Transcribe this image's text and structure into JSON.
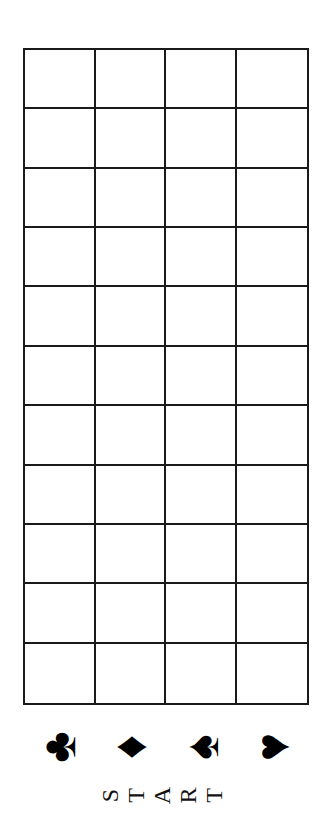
{
  "board": {
    "columns": 4,
    "rows": 11,
    "line_color": "#1a1a1a"
  },
  "suits": [
    {
      "name": "clubs",
      "glyph": "♣"
    },
    {
      "name": "diamonds",
      "glyph": "♦"
    },
    {
      "name": "spades",
      "glyph": "♠"
    },
    {
      "name": "hearts",
      "glyph": "♥"
    }
  ],
  "start_label": {
    "text": "START",
    "letters": [
      "S",
      "T",
      "A",
      "R",
      "T"
    ]
  }
}
